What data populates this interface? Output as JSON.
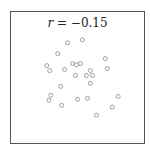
{
  "chart_data": {
    "type": "scatter",
    "title": "r = −0.15",
    "title_parts": {
      "variable": "r",
      "equals": " = ",
      "value": "−0.15"
    },
    "xlabel": "",
    "ylabel": "",
    "xlim": [
      0,
      1
    ],
    "ylim": [
      0,
      1
    ],
    "grid": false,
    "axes_ticks": false,
    "legend": null,
    "marker": {
      "shape": "open-circle",
      "color": "#888888",
      "size_px": 4
    },
    "frame_color": "#555555",
    "points": [
      {
        "x": 0.425,
        "y": 0.765
      },
      {
        "x": 0.537,
        "y": 0.788
      },
      {
        "x": 0.351,
        "y": 0.682
      },
      {
        "x": 0.709,
        "y": 0.644
      },
      {
        "x": 0.269,
        "y": 0.591
      },
      {
        "x": 0.291,
        "y": 0.553
      },
      {
        "x": 0.403,
        "y": 0.561
      },
      {
        "x": 0.463,
        "y": 0.606
      },
      {
        "x": 0.493,
        "y": 0.598
      },
      {
        "x": 0.522,
        "y": 0.606
      },
      {
        "x": 0.724,
        "y": 0.568
      },
      {
        "x": 0.597,
        "y": 0.553
      },
      {
        "x": 0.485,
        "y": 0.515
      },
      {
        "x": 0.567,
        "y": 0.515
      },
      {
        "x": 0.612,
        "y": 0.515
      },
      {
        "x": 0.597,
        "y": 0.455
      },
      {
        "x": 0.373,
        "y": 0.432
      },
      {
        "x": 0.299,
        "y": 0.364
      },
      {
        "x": 0.284,
        "y": 0.326
      },
      {
        "x": 0.5,
        "y": 0.333
      },
      {
        "x": 0.575,
        "y": 0.341
      },
      {
        "x": 0.806,
        "y": 0.356
      },
      {
        "x": 0.381,
        "y": 0.288
      },
      {
        "x": 0.761,
        "y": 0.273
      },
      {
        "x": 0.642,
        "y": 0.212
      }
    ]
  }
}
